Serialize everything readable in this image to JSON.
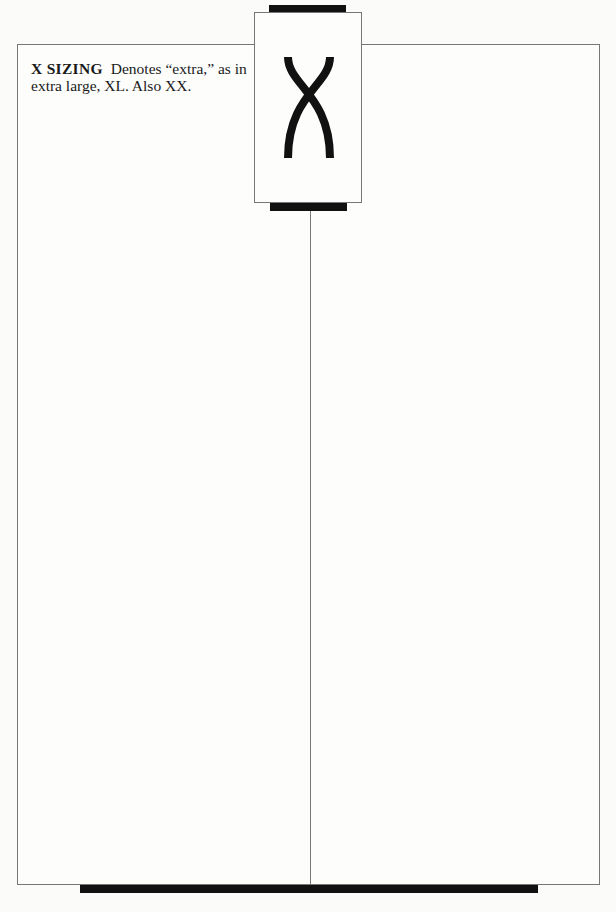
{
  "tab": {
    "letter": "X",
    "icon": "x-letter-glyph"
  },
  "entry": {
    "headword": "X SIZING",
    "definition": "Denotes “extra,” as in extra large, XL. Also XX."
  },
  "colors": {
    "ink": "#111111",
    "rule": "#777777",
    "paper": "#fdfdfc"
  }
}
